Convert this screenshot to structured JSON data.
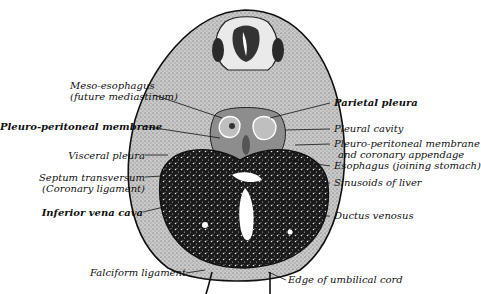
{
  "figure": {
    "type": "anatomical-section",
    "colors": {
      "ink": "#111111",
      "tissue": "#9a9a9a",
      "liver": "#1c1c1c",
      "background": "#ffffff"
    }
  },
  "labels_left": [
    {
      "id": "meso-esophagus",
      "line1": "Meso-esophagus",
      "line2": "(future mediastinum)"
    },
    {
      "id": "pleuro-peritoneal-membrane",
      "line1": "Pleuro-peritoneal membrane"
    },
    {
      "id": "visceral-pleura",
      "line1": "Visceral pleura"
    },
    {
      "id": "septum-transversum",
      "line1": "Septum transversum",
      "line2": "(Coronary ligament)"
    },
    {
      "id": "inferior-vena-cava",
      "line1": "Inferior vena cava"
    },
    {
      "id": "falciform-ligament",
      "line1": "Falciform ligament"
    }
  ],
  "labels_right": [
    {
      "id": "parietal-pleura",
      "line1": "Parietal pleura"
    },
    {
      "id": "pleural-cavity",
      "line1": "Pleural cavity"
    },
    {
      "id": "pleuro-peritoneal-membrane-coronary",
      "line1": "Pleuro-peritoneal membrane",
      "line2": "and coronary appendage"
    },
    {
      "id": "esophagus",
      "line1": "Esophagus (joining stomach)"
    },
    {
      "id": "sinusoids-of-liver",
      "line1": "Sinusoids of liver"
    },
    {
      "id": "ductus-venosus",
      "line1": "Ductus venosus"
    },
    {
      "id": "edge-of-umbilical-cord",
      "line1": "Edge of umbilical cord"
    }
  ]
}
